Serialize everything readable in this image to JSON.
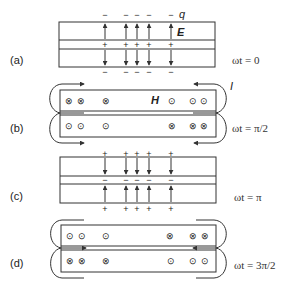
{
  "figure": {
    "panels": [
      {
        "id": "a",
        "label": "(a)",
        "time_label": "ωt = 0",
        "field": "E",
        "charge_label": "q",
        "top_signs": [
          "−",
          "−",
          "−",
          "−",
          "−"
        ],
        "middle_signs": [
          "+",
          "+",
          "+",
          "+",
          "+"
        ],
        "bottom_signs": [
          "−",
          "−",
          "−",
          "−",
          "−"
        ]
      },
      {
        "id": "b",
        "label": "(b)",
        "time_label": "ωt = π/2",
        "field": "H",
        "current_label": "I",
        "top_row": [
          "⊗",
          "⊗",
          "⊗",
          "⊙",
          "⊙",
          "⊙"
        ],
        "bottom_row": [
          "⊙",
          "⊙",
          "⊙",
          "⊗",
          "⊗",
          "⊗"
        ]
      },
      {
        "id": "c",
        "label": "(c)",
        "time_label": "ωt = π",
        "top_signs": [
          "+",
          "+",
          "+",
          "+",
          "+"
        ],
        "middle_signs": [
          "−",
          "−",
          "−",
          "−",
          "−"
        ],
        "bottom_signs": [
          "+",
          "+",
          "+",
          "+",
          "+"
        ]
      },
      {
        "id": "d",
        "label": "(d)",
        "time_label": "ωt = 3π/2",
        "top_row": [
          "⊙",
          "⊙",
          "⊙",
          "⊗",
          "⊗",
          "⊗"
        ],
        "bottom_row": [
          "⊗",
          "⊗",
          "⊗",
          "⊙",
          "⊙",
          "⊙"
        ]
      }
    ],
    "colors": {
      "stroke": "#333333",
      "text": "#222222",
      "background": "#ffffff"
    }
  }
}
